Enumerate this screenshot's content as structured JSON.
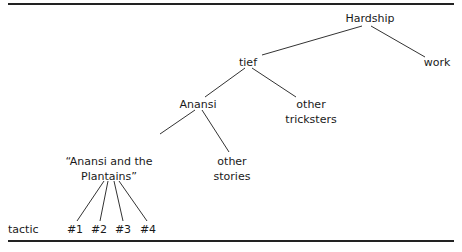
{
  "tree": {
    "root": "Hardship",
    "nodes": {
      "hardship": "Hardship",
      "work": "work",
      "tief": "tief",
      "anansi": "Anansi",
      "other_tricksters_1": "other",
      "other_tricksters_2": "tricksters",
      "story_1": "“Anansi and the",
      "story_2": "Plantains”",
      "other_stories_1": "other",
      "other_stories_2": "stories"
    },
    "row_label": "tactic",
    "tactics": [
      "#1",
      "#2",
      "#3",
      "#4"
    ],
    "edges": [
      [
        "Hardship",
        "tief"
      ],
      [
        "Hardship",
        "work"
      ],
      [
        "tief",
        "Anansi"
      ],
      [
        "tief",
        "other tricksters"
      ],
      [
        "Anansi",
        "“Anansi and the Plantains”"
      ],
      [
        "Anansi",
        "other stories"
      ],
      [
        "“Anansi and the Plantains”",
        "#1"
      ],
      [
        "“Anansi and the Plantains”",
        "#2"
      ],
      [
        "“Anansi and the Plantains”",
        "#3"
      ],
      [
        "“Anansi and the Plantains”",
        "#4"
      ]
    ]
  }
}
